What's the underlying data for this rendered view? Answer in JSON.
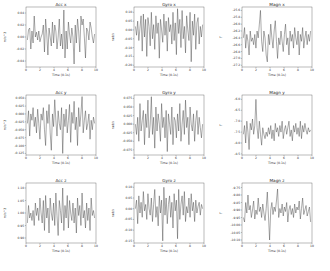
{
  "chart_data": [
    {
      "id": "acc_x",
      "type": "line",
      "title": "Acc x",
      "xlabel": "Time (0.1s)",
      "ylabel": "m/s^2",
      "xlim": [
        0,
        10
      ],
      "ylim": [
        -0.05,
        0.05
      ],
      "xticks": [
        0,
        2,
        4,
        6,
        8,
        10
      ],
      "yticks": [
        0.04,
        0.02,
        0.0,
        -0.02,
        -0.04
      ],
      "ytick_labels": [
        "0.04",
        "0.02",
        "0.00",
        "-0.02",
        "-0.04"
      ],
      "values": [
        -0.005,
        0.012,
        0.015,
        -0.02,
        0.01,
        -0.01,
        0.035,
        0.0,
        0.008,
        -0.005,
        0.01,
        -0.008,
        0.0,
        0.005,
        0.02,
        -0.025,
        0.03,
        0.005,
        -0.03,
        0.015,
        0.0,
        -0.015,
        0.025,
        -0.01,
        0.02,
        0.01,
        -0.02,
        0.0,
        0.03,
        -0.015,
        0.005,
        -0.02,
        0.045,
        -0.035,
        0.01,
        -0.02,
        0.025,
        0.005,
        -0.01,
        0.015,
        0.0,
        -0.045,
        0.02,
        -0.01,
        0.03,
        0.01,
        -0.025,
        0.035,
        0.02,
        0.03,
        0.0,
        -0.035,
        0.015,
        0.01,
        -0.005,
        0.025,
        0.015,
        0.0,
        -0.01,
        0.005
      ]
    },
    {
      "id": "gyro_x",
      "type": "line",
      "title": "Gyro x",
      "xlabel": "Time (0.1s)",
      "ylabel": "rad/s",
      "xlim": [
        0,
        10
      ],
      "ylim": [
        -0.21,
        0.13
      ],
      "xticks": [
        0,
        2,
        4,
        6,
        8,
        10
      ],
      "yticks": [
        0.1,
        0.05,
        0.0,
        -0.05,
        -0.1,
        -0.15,
        -0.2
      ],
      "ytick_labels": [
        "0.10",
        "0.05",
        "0.00",
        "-0.05",
        "-0.10",
        "-0.15",
        "-0.20"
      ],
      "values": [
        0.02,
        -0.03,
        0.05,
        -0.06,
        0.01,
        0.08,
        -0.12,
        0.09,
        -0.04,
        0.06,
        -0.15,
        0.07,
        0.02,
        -0.09,
        0.1,
        -0.05,
        0.03,
        -0.11,
        0.08,
        -0.02,
        0.04,
        -0.16,
        0.06,
        0.0,
        -0.07,
        0.09,
        -0.03,
        0.05,
        -0.12,
        0.07,
        -0.01,
        0.03,
        -0.08,
        0.1,
        -0.06,
        0.04,
        -0.14,
        0.12,
        -0.02,
        0.06,
        -0.1,
        0.11,
        -0.05,
        0.02,
        -0.13,
        0.08,
        0.0,
        -0.06,
        0.1,
        -0.18,
        0.05,
        -0.03,
        0.09,
        -0.11,
        0.04,
        0.07,
        -0.08,
        0.02,
        -0.04,
        0.03
      ]
    },
    {
      "id": "magn_x",
      "type": "line",
      "title": "Magn x",
      "xlabel": "Time (0.1s)",
      "ylabel": "T",
      "xlim": [
        0,
        10
      ],
      "ylim": [
        -27.25,
        -25.5
      ],
      "xticks": [
        0,
        2,
        4,
        6,
        8,
        10
      ],
      "yticks": [
        -25.6,
        -25.8,
        -26.0,
        -26.2,
        -26.4,
        -26.6,
        -26.8,
        -27.0,
        -27.2
      ],
      "ytick_labels": [
        "-25.6",
        "-25.8",
        "-26.0",
        "-26.2",
        "-26.4",
        "-26.6",
        "-26.8",
        "-27.0",
        "-27.2"
      ],
      "values": [
        -26.4,
        -26.1,
        -26.7,
        -26.3,
        -26.5,
        -26.9,
        -26.2,
        -26.5,
        -26.4,
        -26.6,
        -26.3,
        -26.7,
        -26.2,
        -26.4,
        -26.0,
        -25.6,
        -26.5,
        -26.8,
        -26.2,
        -26.4,
        -26.9,
        -27.1,
        -26.3,
        -26.6,
        -26.0,
        -26.4,
        -26.7,
        -26.2,
        -25.9,
        -26.5,
        -27.0,
        -26.4,
        -26.6,
        -26.2,
        -26.5,
        -26.8,
        -26.3,
        -26.0,
        -26.6,
        -26.4,
        -26.9,
        -26.2,
        -26.5,
        -26.3,
        -26.7,
        -26.1,
        -26.4,
        -26.6,
        -26.2,
        -26.9,
        -26.3,
        -26.5,
        -26.1,
        -26.7,
        -26.4,
        -26.2,
        -26.6,
        -26.3,
        -26.5,
        -26.2
      ]
    },
    {
      "id": "acc_y",
      "type": "line",
      "title": "Acc y",
      "xlabel": "Time (0.1s)",
      "ylabel": "m/s^2",
      "xlim": [
        0,
        10
      ],
      "ylim": [
        -0.13,
        0.06
      ],
      "xticks": [
        0,
        2,
        4,
        6,
        8,
        10
      ],
      "yticks": [
        0.05,
        0.025,
        0.0,
        -0.025,
        -0.05,
        -0.075,
        -0.1,
        -0.125
      ],
      "ytick_labels": [
        "0.050",
        "0.025",
        "0.000",
        "-0.025",
        "-0.050",
        "-0.075",
        "-0.100",
        "-0.125"
      ],
      "values": [
        -0.03,
        0.01,
        -0.07,
        0.0,
        -0.02,
        0.02,
        -0.04,
        -0.01,
        -0.06,
        0.015,
        -0.03,
        -0.08,
        0.0,
        -0.02,
        0.02,
        -0.05,
        -0.1,
        0.01,
        -0.03,
        0.03,
        -0.06,
        -0.115,
        0.0,
        -0.04,
        0.045,
        -0.02,
        -0.07,
        0.01,
        -0.03,
        -0.05,
        0.02,
        -0.125,
        0.0,
        -0.04,
        0.015,
        -0.06,
        -0.02,
        0.03,
        -0.09,
        0.005,
        -0.03,
        0.04,
        -0.05,
        -0.01,
        -0.1,
        0.02,
        -0.04,
        0.0,
        0.055,
        -0.06,
        -0.02,
        0.01,
        -0.05,
        -0.03,
        0.0,
        -0.08,
        -0.02,
        -0.05,
        -0.01,
        -0.03
      ]
    },
    {
      "id": "gyro_y",
      "type": "line",
      "title": "Gyro y",
      "xlabel": "Time (0.1s)",
      "ylabel": "rad/s",
      "xlim": [
        0,
        10
      ],
      "ylim": [
        -0.09,
        0.085
      ],
      "xticks": [
        0,
        2,
        4,
        6,
        8,
        10
      ],
      "yticks": [
        0.075,
        0.05,
        0.025,
        0.0,
        -0.025,
        -0.05,
        -0.075
      ],
      "ytick_labels": [
        "0.075",
        "0.050",
        "0.025",
        "0.000",
        "-0.025",
        "-0.050",
        "-0.075"
      ],
      "values": [
        0.0,
        -0.03,
        0.02,
        -0.05,
        0.06,
        -0.02,
        0.01,
        0.04,
        -0.06,
        0.03,
        -0.01,
        0.07,
        -0.04,
        0.0,
        0.08,
        -0.03,
        0.02,
        -0.07,
        0.05,
        -0.02,
        0.03,
        0.0,
        -0.05,
        0.06,
        -0.01,
        0.02,
        -0.04,
        0.04,
        -0.08,
        0.03,
        0.0,
        -0.03,
        0.05,
        -0.06,
        0.02,
        0.01,
        -0.04,
        0.03,
        -0.02,
        0.06,
        -0.05,
        0.0,
        0.04,
        -0.03,
        0.07,
        -0.01,
        0.02,
        -0.06,
        0.05,
        0.0,
        -0.02,
        0.03,
        -0.05,
        0.01,
        0.04,
        -0.03,
        0.02,
        -0.01,
        -0.04,
        0.0
      ]
    },
    {
      "id": "magn_y",
      "type": "line",
      "title": "Magn y",
      "xlabel": "Time (0.1s)",
      "ylabel": "T",
      "xlim": [
        0,
        10
      ],
      "ylim": [
        -8.55,
        -5.8
      ],
      "xticks": [
        0,
        2,
        4,
        6,
        8,
        10
      ],
      "yticks": [
        -6.0,
        -6.5,
        -7.0,
        -7.5,
        -8.0,
        -8.5
      ],
      "ytick_labels": [
        "-6.0",
        "-6.5",
        "-7.0",
        "-7.5",
        "-8.0",
        "-8.5"
      ],
      "values": [
        -7.6,
        -7.2,
        -8.0,
        -7.0,
        -7.5,
        -8.3,
        -7.1,
        -7.4,
        -6.9,
        -7.6,
        -7.2,
        -6.0,
        -7.3,
        -7.8,
        -7.0,
        -7.6,
        -8.1,
        -7.3,
        -7.6,
        -7.8,
        -7.5,
        -7.7,
        -7.3,
        -7.6,
        -7.2,
        -7.8,
        -7.4,
        -7.9,
        -7.1,
        -7.5,
        -7.3,
        -7.7,
        -7.2,
        -7.5,
        -7.0,
        -7.8,
        -7.4,
        -7.2,
        -7.6,
        -7.3,
        -7.0,
        -7.7,
        -7.4,
        -7.9,
        -7.2,
        -7.5,
        -7.1,
        -7.6,
        -7.3,
        -7.7,
        -7.0,
        -7.8,
        -7.2,
        -7.5,
        -7.1,
        -7.4,
        -7.6,
        -7.3,
        -7.5,
        -7.4
      ]
    },
    {
      "id": "acc_z",
      "type": "line",
      "title": "Acc z",
      "xlabel": "Time (0.1s)",
      "ylabel": "m/s^2",
      "xlim": [
        0,
        10
      ],
      "ylim": [
        0.88,
        1.12
      ],
      "xticks": [
        0,
        2,
        4,
        6,
        8,
        10
      ],
      "yticks": [
        1.1,
        1.05,
        1.0,
        0.95,
        0.9
      ],
      "ytick_labels": [
        "1.10",
        "1.05",
        "1.00",
        "0.95",
        "0.90"
      ],
      "values": [
        0.96,
        1.03,
        0.98,
        1.0,
        0.97,
        1.01,
        0.95,
        1.04,
        0.99,
        1.02,
        0.97,
        1.06,
        1.0,
        0.96,
        1.05,
        0.93,
        1.07,
        0.98,
        1.02,
        0.92,
        1.06,
        1.0,
        0.97,
        1.04,
        0.95,
        1.08,
        0.99,
        0.91,
        1.05,
        1.01,
        0.96,
        1.1,
        0.93,
        1.03,
        0.98,
        1.07,
        0.94,
        1.05,
        1.0,
        0.97,
        1.04,
        0.96,
        1.02,
        0.92,
        1.06,
        0.99,
        1.03,
        0.95,
        1.08,
        0.98,
        1.01,
        0.94,
        1.04,
        0.97,
        1.02,
        0.93,
        1.06,
        0.99,
        1.01,
        0.98
      ]
    },
    {
      "id": "gyro_z",
      "type": "line",
      "title": "Gyro z",
      "xlabel": "Time (0.1s)",
      "ylabel": "rad/s",
      "xlim": [
        0,
        10
      ],
      "ylim": [
        -0.16,
        0.12
      ],
      "xticks": [
        0,
        2,
        4,
        6,
        8,
        10
      ],
      "yticks": [
        0.1,
        0.05,
        0.0,
        -0.05,
        -0.1,
        -0.15
      ],
      "ytick_labels": [
        "0.10",
        "0.05",
        "0.00",
        "-0.05",
        "-0.10",
        "-0.15"
      ],
      "values": [
        0.0,
        0.04,
        -0.07,
        0.06,
        -0.02,
        0.03,
        -0.04,
        0.08,
        -0.01,
        0.02,
        -0.05,
        0.07,
        0.0,
        -0.03,
        0.05,
        -0.06,
        0.02,
        0.09,
        -0.04,
        0.01,
        -0.08,
        0.06,
        -0.02,
        0.04,
        -0.15,
        0.1,
        -0.03,
        0.05,
        -0.07,
        0.02,
        0.06,
        -0.04,
        0.03,
        -0.09,
        0.07,
        -0.01,
        0.04,
        -0.14,
        0.09,
        -0.05,
        0.02,
        0.06,
        -0.03,
        0.08,
        -0.06,
        0.01,
        -0.02,
        0.05,
        -0.04,
        0.07,
        -0.01,
        0.03,
        -0.06,
        0.04,
        -0.02,
        0.01,
        0.03,
        -0.03,
        0.02,
        0.0
      ]
    },
    {
      "id": "magn_z",
      "type": "line",
      "title": "Magn z",
      "xlabel": "Time (0.1s)",
      "ylabel": "T",
      "xlim": [
        0,
        10
      ],
      "ylim": [
        -10.12,
        -9.72
      ],
      "xticks": [
        0,
        2,
        4,
        6,
        8,
        10
      ],
      "yticks": [
        -9.75,
        -9.8,
        -9.85,
        -9.9,
        -9.95,
        -10.0,
        -10.05,
        -10.1
      ],
      "ytick_labels": [
        "-9.75",
        "-9.80",
        "-9.85",
        "-9.90",
        "-9.95",
        "-10.00",
        "-10.05",
        "-10.10"
      ],
      "values": [
        -9.95,
        -9.98,
        -9.85,
        -9.92,
        -9.8,
        -9.9,
        -9.87,
        -9.95,
        -9.9,
        -9.84,
        -9.96,
        -9.9,
        -9.93,
        -9.82,
        -9.91,
        -9.88,
        -9.95,
        -9.86,
        -9.92,
        -9.97,
        -9.89,
        -9.78,
        -9.94,
        -10.1,
        -9.9,
        -9.85,
        -9.93,
        -9.88,
        -9.91,
        -9.84,
        -9.76,
        -9.95,
        -9.89,
        -9.92,
        -9.86,
        -9.94,
        -9.88,
        -9.91,
        -9.85,
        -9.98,
        -9.9,
        -9.87,
        -9.93,
        -9.89,
        -9.95,
        -9.86,
        -9.92,
        -9.88,
        -9.9,
        -9.84,
        -9.96,
        -9.89,
        -9.82,
        -9.93,
        -9.9,
        -9.87,
        -9.94,
        -9.91,
        -9.88,
        -9.98
      ]
    }
  ]
}
